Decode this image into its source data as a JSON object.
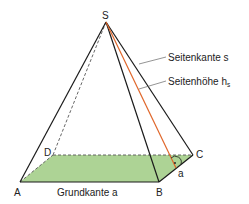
{
  "diagram": {
    "colors": {
      "edge": "#1a1a1a",
      "hidden_edge": "#555555",
      "base_fill": "#9fcb83",
      "height_line": "#e0662a",
      "leader": "#666666"
    },
    "vertices": {
      "S": {
        "label": "S",
        "x": 106,
        "y": 22
      },
      "A": {
        "label": "A",
        "x": 20,
        "y": 182
      },
      "B": {
        "label": "B",
        "x": 159,
        "y": 182
      },
      "C": {
        "label": "C",
        "x": 193,
        "y": 155
      },
      "D": {
        "label": "D",
        "x": 53,
        "y": 155
      }
    },
    "labels": {
      "seitenkante": "Seitenkante s",
      "seitenhoehe": "Seitenhöhe h",
      "seitenhoehe_sub": "s",
      "grundkante": "Grundkante a",
      "a_short": "a"
    }
  }
}
